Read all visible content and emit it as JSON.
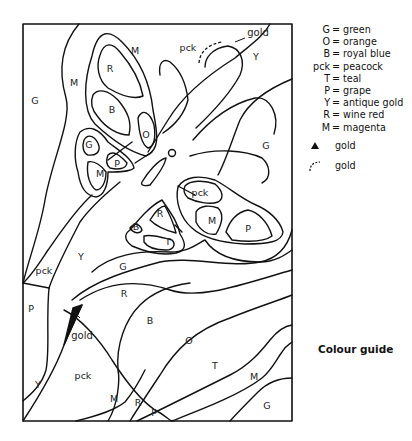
{
  "figure": {
    "title": "Colour guide",
    "frame": {
      "x": 23,
      "y": 24,
      "width": 269,
      "height": 397
    }
  },
  "legend": {
    "entries": [
      {
        "code": "G",
        "colour": "green"
      },
      {
        "code": "O",
        "colour": "orange"
      },
      {
        "code": "B",
        "colour": "royal blue"
      },
      {
        "code": "pck",
        "colour": "peacock"
      },
      {
        "code": "T",
        "colour": "teal"
      },
      {
        "code": "P",
        "colour": "grape"
      },
      {
        "code": "Y",
        "colour": "antique gold"
      },
      {
        "code": "R",
        "colour": "wine red"
      },
      {
        "code": "M",
        "colour": "magenta"
      }
    ],
    "symbols": [
      {
        "symbol": "filled-triangle",
        "label": "gold"
      },
      {
        "symbol": "dashed-arc",
        "label": "gold"
      }
    ]
  },
  "region_labels": [
    {
      "text": "G",
      "x": 35,
      "y": 101
    },
    {
      "text": "M",
      "x": 74,
      "y": 83
    },
    {
      "text": "M",
      "x": 135,
      "y": 51
    },
    {
      "text": "R",
      "x": 110,
      "y": 69
    },
    {
      "text": "B",
      "x": 112,
      "y": 110
    },
    {
      "text": "O",
      "x": 146,
      "y": 135
    },
    {
      "text": "G",
      "x": 89,
      "y": 145
    },
    {
      "text": "P",
      "x": 117,
      "y": 164
    },
    {
      "text": "M",
      "x": 100,
      "y": 174
    },
    {
      "text": "pck",
      "x": 188,
      "y": 48
    },
    {
      "text": "Y",
      "x": 256,
      "y": 57
    },
    {
      "text": "G",
      "x": 266,
      "y": 146
    },
    {
      "text": "pck",
      "x": 200,
      "y": 193
    },
    {
      "text": "R",
      "x": 160,
      "y": 214
    },
    {
      "text": "M",
      "x": 212,
      "y": 221
    },
    {
      "text": "P",
      "x": 248,
      "y": 229
    },
    {
      "text": "B",
      "x": 136,
      "y": 227
    },
    {
      "text": "T",
      "x": 168,
      "y": 242
    },
    {
      "text": "Y",
      "x": 81,
      "y": 257
    },
    {
      "text": "pck",
      "x": 44,
      "y": 271
    },
    {
      "text": "G",
      "x": 123,
      "y": 267
    },
    {
      "text": "P",
      "x": 31,
      "y": 309
    },
    {
      "text": "R",
      "x": 124,
      "y": 294
    },
    {
      "text": "B",
      "x": 150,
      "y": 321
    },
    {
      "text": "O",
      "x": 189,
      "y": 341
    },
    {
      "text": "T",
      "x": 215,
      "y": 366
    },
    {
      "text": "M",
      "x": 254,
      "y": 377
    },
    {
      "text": "G",
      "x": 267,
      "y": 406
    },
    {
      "text": "Y",
      "x": 38,
      "y": 385
    },
    {
      "text": "pck",
      "x": 83,
      "y": 376
    },
    {
      "text": "M",
      "x": 114,
      "y": 399
    },
    {
      "text": "R",
      "x": 138,
      "y": 403
    },
    {
      "text": "P",
      "x": 154,
      "y": 413
    }
  ],
  "annotations": [
    {
      "text": "gold",
      "x": 256,
      "y": 33
    },
    {
      "text": "gold",
      "x": 82,
      "y": 336
    }
  ]
}
